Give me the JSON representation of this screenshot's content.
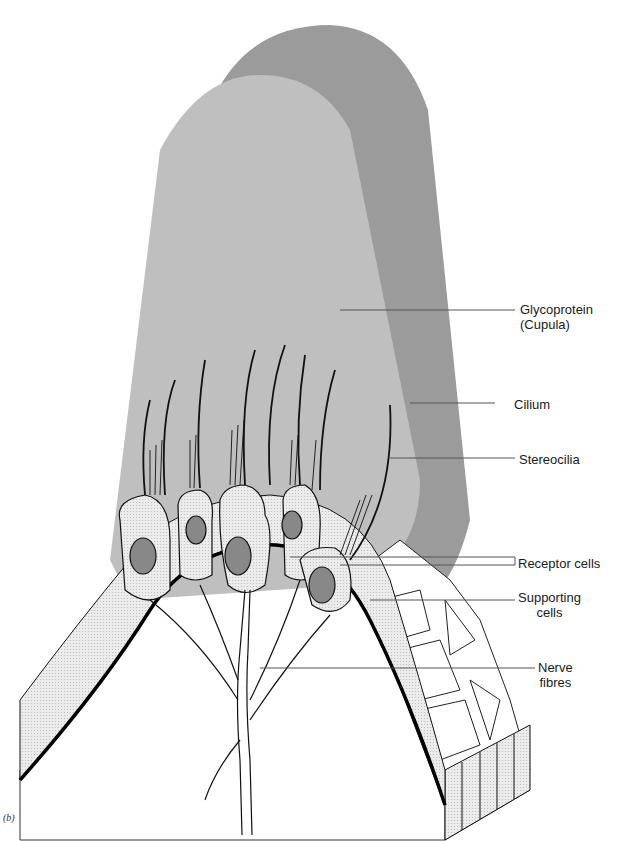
{
  "figure": {
    "panel_label": "(b)",
    "colors": {
      "cupula_front": "#bdbdbd",
      "cupula_back": "#9a9a9a",
      "cell_fill": "#e6e6e6",
      "nucleus": "#8a8a8a",
      "outline": "#111111",
      "background": "#ffffff"
    }
  },
  "labels": [
    {
      "id": "glycoprotein",
      "text": "Glycoprotein\n(Cupula)"
    },
    {
      "id": "cilium",
      "text": "Cilium"
    },
    {
      "id": "stereocilia",
      "text": "Stereocilia"
    },
    {
      "id": "receptor-cells",
      "text": "Receptor cells"
    },
    {
      "id": "supporting-cells",
      "text": "Supporting\ncells"
    },
    {
      "id": "nerve-fibres",
      "text": "Nerve\nfibres"
    }
  ]
}
